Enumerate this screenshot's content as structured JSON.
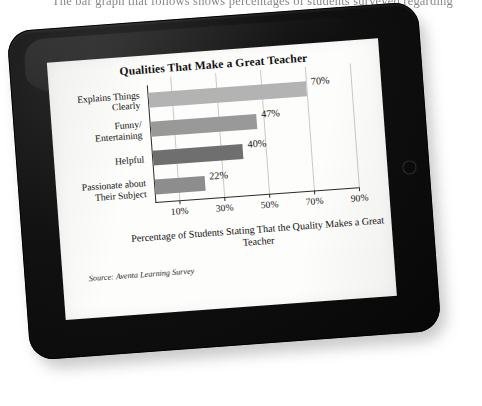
{
  "page": {
    "top_text": "The bar graph that follows shows percentages of students surveyed regarding"
  },
  "device": {
    "name": "tablet",
    "bezel_color": "#0b0b0b",
    "screen_color": "#fdfdfb",
    "home_button": "home-button"
  },
  "chart_data": {
    "type": "bar",
    "orientation": "horizontal",
    "title": "Qualities That Make a Great Teacher",
    "xlabel": "Percentage of Students Stating That the Quality Makes a Great Teacher",
    "ylabel": "",
    "categories": [
      "Explains Things Clearly",
      "Funny/ Entertaining",
      "Helpful",
      "Passionate about Their Subject"
    ],
    "values": [
      70,
      47,
      40,
      22
    ],
    "value_labels": [
      "70%",
      "47%",
      "40%",
      "22%"
    ],
    "bar_colors": [
      "#b3b3b3",
      "#999999",
      "#6f6f6f",
      "#8d8d8d"
    ],
    "xlim": [
      0,
      90
    ],
    "xticks": [
      10,
      30,
      50,
      70,
      90
    ],
    "xtick_labels": [
      "10%",
      "30%",
      "50%",
      "70%",
      "90%"
    ],
    "grid": true,
    "grid_color": "#c9c9c9",
    "legend": null,
    "source": "Source: Aventa Learning Survey",
    "source_prefix": "Source:",
    "source_name": "Aventa Learning Survey"
  }
}
